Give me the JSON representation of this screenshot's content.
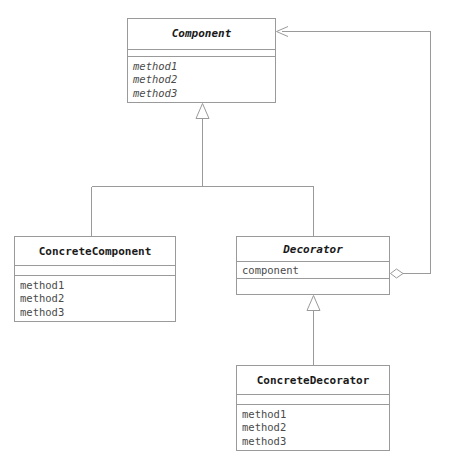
{
  "diagram": {
    "kind": "uml-class-diagram",
    "width": 449,
    "height": 458,
    "background": "#ffffff",
    "line_color": "#9a9a9a",
    "text_color": "#1a1a1a",
    "member_text_color": "#4a4a4a"
  },
  "classes": [
    {
      "id": "component",
      "name": "Component",
      "abstract": true,
      "attributes": [],
      "operations": [
        "method1",
        "method2",
        "method3"
      ],
      "operations_abstract": true,
      "box": {
        "x": 127,
        "y": 18,
        "w": 149,
        "h": 85
      },
      "title_h": 37,
      "attrs_h": 8
    },
    {
      "id": "concrete-component",
      "name": "ConcreteComponent",
      "abstract": false,
      "attributes": [],
      "operations": [
        "method1",
        "method2",
        "method3"
      ],
      "operations_abstract": false,
      "box": {
        "x": 14,
        "y": 236,
        "w": 162,
        "h": 86
      },
      "title_h": 32,
      "attrs_h": 10
    },
    {
      "id": "decorator",
      "name": "Decorator",
      "abstract": true,
      "attributes": [
        "component"
      ],
      "operations": [],
      "operations_abstract": false,
      "box": {
        "x": 236,
        "y": 236,
        "w": 154,
        "h": 59
      },
      "title_h": 25,
      "attrs_h": 17
    },
    {
      "id": "concrete-decorator",
      "name": "ConcreteDecorator",
      "abstract": false,
      "attributes": [],
      "operations": [
        "method1",
        "method2",
        "method3"
      ],
      "operations_abstract": false,
      "box": {
        "x": 236,
        "y": 365,
        "w": 154,
        "h": 86
      },
      "title_h": 32,
      "attrs_h": 10
    }
  ],
  "relationships": [
    {
      "id": "rel-concrete-component-generalization",
      "type": "generalization",
      "from": "ConcreteComponent",
      "to": "Component",
      "marker": "hollow-triangle"
    },
    {
      "id": "rel-decorator-generalization",
      "type": "generalization",
      "from": "Decorator",
      "to": "Component",
      "marker": "hollow-triangle"
    },
    {
      "id": "rel-concrete-decorator-generalization",
      "type": "generalization",
      "from": "ConcreteDecorator",
      "to": "Decorator",
      "marker": "hollow-triangle"
    },
    {
      "id": "rel-decorator-aggregation",
      "type": "aggregation",
      "from": "Decorator",
      "to": "Component",
      "marker": "hollow-diamond-and-open-arrow"
    }
  ]
}
